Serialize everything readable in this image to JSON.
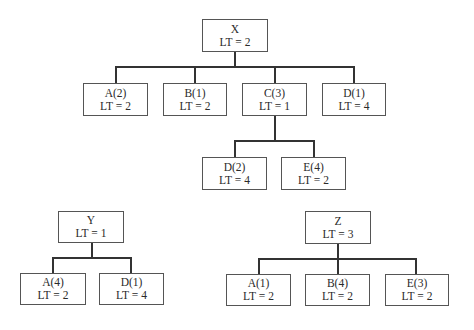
{
  "trees": {
    "x": {
      "root": {
        "name": "X",
        "lt": "LT = 2"
      },
      "children": [
        {
          "name": "A(2)",
          "lt": "LT = 2"
        },
        {
          "name": "B(1)",
          "lt": "LT = 2"
        },
        {
          "name": "C(3)",
          "lt": "LT = 1"
        },
        {
          "name": "D(1)",
          "lt": "LT = 4"
        }
      ],
      "grandchildren": [
        {
          "name": "D(2)",
          "lt": "LT = 4"
        },
        {
          "name": "E(4)",
          "lt": "LT = 2"
        }
      ]
    },
    "y": {
      "root": {
        "name": "Y",
        "lt": "LT = 1"
      },
      "children": [
        {
          "name": "A(4)",
          "lt": "LT = 2"
        },
        {
          "name": "D(1)",
          "lt": "LT = 4"
        }
      ]
    },
    "z": {
      "root": {
        "name": "Z",
        "lt": "LT = 3"
      },
      "children": [
        {
          "name": "A(1)",
          "lt": "LT = 2"
        },
        {
          "name": "B(4)",
          "lt": "LT = 2"
        },
        {
          "name": "E(3)",
          "lt": "LT = 2"
        }
      ]
    }
  }
}
